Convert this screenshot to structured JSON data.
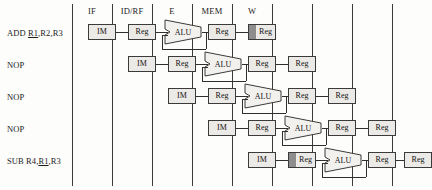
{
  "figure": {
    "background_color": "#fdfdfb",
    "line_color": "#3a3a3a",
    "box_fill": "#eceae6",
    "shade_color": "#8d8d8d"
  },
  "stages": [
    {
      "id": "if",
      "label": "IF",
      "x": 92
    },
    {
      "id": "idrf",
      "label": "ID/RF",
      "x": 132
    },
    {
      "id": "e",
      "label": "E",
      "x": 172
    },
    {
      "id": "mem",
      "label": "MEM",
      "x": 212
    },
    {
      "id": "w",
      "label": "W",
      "x": 252
    }
  ],
  "separators": [
    72,
    112,
    152,
    192,
    232,
    272,
    312,
    352,
    392
  ],
  "instructions": [
    {
      "id": "row-1",
      "text_before": "ADD ",
      "underlined": "R1",
      "text_after": ",R2,R3",
      "row": 0
    },
    {
      "id": "row-2",
      "text_before": "NOP",
      "underlined": "",
      "text_after": "",
      "row": 1
    },
    {
      "id": "row-3",
      "text_before": "NOP",
      "underlined": "",
      "text_after": "",
      "row": 2
    },
    {
      "id": "row-4",
      "text_before": "NOP",
      "underlined": "",
      "text_after": "",
      "row": 3
    },
    {
      "id": "row-5",
      "text_before": "SUB R4,",
      "underlined": "R1",
      "text_after": ",R3",
      "row": 4
    }
  ],
  "units": {
    "im_label": "IM",
    "reg_label": "Reg",
    "alu_label": "ALU"
  },
  "rows": [
    {
      "id": "pipeline-row-1",
      "y": 24,
      "im_x": 88,
      "reg1_x": 128,
      "alu_x": 164,
      "reg2_x": 208,
      "reg3_x": 248,
      "reg3_shaded": true,
      "reg4_x": null,
      "reg4_shaded": false,
      "reg1_shaded": false
    },
    {
      "id": "pipeline-row-2",
      "y": 56,
      "im_x": 128,
      "reg1_x": 168,
      "alu_x": 204,
      "reg2_x": 248,
      "reg3_x": 288,
      "reg3_shaded": false,
      "reg4_x": null,
      "reg4_shaded": false,
      "reg1_shaded": false
    },
    {
      "id": "pipeline-row-3",
      "y": 88,
      "im_x": 168,
      "reg1_x": 208,
      "alu_x": 244,
      "reg2_x": 288,
      "reg3_x": 328,
      "reg3_shaded": false,
      "reg4_x": null,
      "reg4_shaded": false,
      "reg1_shaded": false
    },
    {
      "id": "pipeline-row-4",
      "y": 120,
      "im_x": 208,
      "reg1_x": 248,
      "alu_x": 284,
      "reg2_x": 328,
      "reg3_x": 368,
      "reg3_shaded": false,
      "reg4_x": null,
      "reg4_shaded": false,
      "reg1_shaded": false
    },
    {
      "id": "pipeline-row-5",
      "y": 152,
      "im_x": 248,
      "reg1_x": 288,
      "alu_x": 324,
      "reg2_x": 368,
      "reg3_x": 404,
      "reg3_shaded": false,
      "reg4_x": null,
      "reg4_shaded": false,
      "reg1_shaded": true
    }
  ]
}
